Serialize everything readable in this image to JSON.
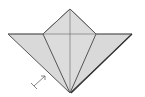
{
  "diagram": {
    "type": "origami-fold-step",
    "colors": {
      "paper": "#d9d9d9",
      "line": "#555555",
      "background": "#ffffff"
    },
    "points": {
      "top": [
        70,
        9
      ],
      "left_tip": [
        8,
        34
      ],
      "right_tip": [
        132,
        34
      ],
      "bottom": [
        70,
        93
      ],
      "inner_left": [
        43,
        34
      ],
      "inner_right": [
        96,
        34
      ]
    },
    "symbols": [
      {
        "name": "fold-and-unfold-arrow",
        "from": [
          33,
          87
        ],
        "to": [
          46,
          75
        ]
      }
    ]
  }
}
